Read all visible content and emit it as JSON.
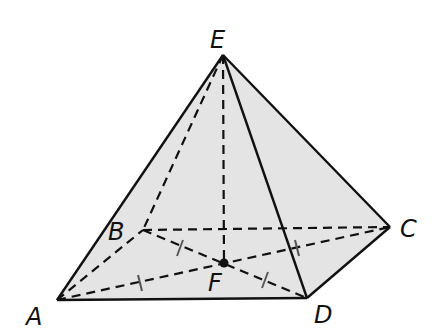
{
  "figure": {
    "type": "square pyramid",
    "fill_color": "#e4e4e4",
    "stroke_color": "#111111",
    "vertices": {
      "A": {
        "label": "A",
        "x": 57,
        "y": 300,
        "label_x": 26,
        "label_y": 325
      },
      "B": {
        "label": "B",
        "x": 143,
        "y": 230,
        "label_x": 108,
        "label_y": 240
      },
      "C": {
        "label": "C",
        "x": 390,
        "y": 227,
        "label_x": 400,
        "label_y": 237
      },
      "D": {
        "label": "D",
        "x": 307,
        "y": 298,
        "label_x": 314,
        "label_y": 323
      },
      "E": {
        "label": "E",
        "x": 223,
        "y": 55,
        "label_x": 210,
        "label_y": 48
      },
      "F": {
        "label": "F",
        "x": 224,
        "y": 263,
        "label_x": 208,
        "label_y": 291
      }
    },
    "solid_edges": [
      "EA",
      "ED",
      "EC",
      "AD",
      "DC"
    ],
    "dashed_edges": [
      "EB",
      "EF",
      "BC",
      "AB",
      "AC",
      "BD"
    ],
    "tick_marks": [
      "AF",
      "BF",
      "CF",
      "DF"
    ],
    "center_point": "F"
  }
}
